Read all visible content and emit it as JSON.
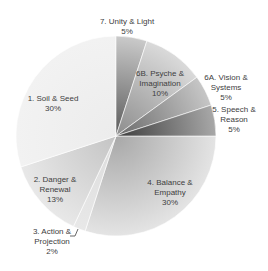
{
  "chart_data": {
    "type": "pie",
    "title": "",
    "start_angle_deg": 0,
    "direction": "clockwise",
    "categories": [
      "4. Balance & Empathy",
      "3. Action & Projection",
      "2. Danger & Renewal",
      "1. Soil & Seed",
      "7. Unity & Light",
      "6B. Psyche & Imagination",
      "6A. Vision & Systems",
      "5. Speech & Reason"
    ],
    "values": [
      30,
      2,
      13,
      30,
      5,
      10,
      5,
      5
    ],
    "unit": "%",
    "legend": "none (data labels on/near slices)",
    "slices": [
      {
        "id": "balance",
        "value": 30,
        "lines": [
          "4. Balance &",
          "Empathy",
          "30%"
        ],
        "label_x": 170,
        "label_y": 185,
        "inner": "#a8a8a8",
        "outer": "#e4e4e4"
      },
      {
        "id": "action",
        "value": 2,
        "lines": [
          "3. Action &",
          "Projection",
          "2%"
        ],
        "label_x": 52,
        "label_y": 234,
        "inner": "#dcdcdc",
        "outer": "#e8e8e8"
      },
      {
        "id": "danger",
        "value": 13,
        "lines": [
          "2. Danger &",
          "Renewal",
          "13%"
        ],
        "label_x": 55,
        "label_y": 182,
        "inner": "#c4c4c4",
        "outer": "#e8e8e8"
      },
      {
        "id": "soil",
        "value": 30,
        "lines": [
          "1. Soil & Seed",
          "30%"
        ],
        "label_x": 53,
        "label_y": 101,
        "inner": "#ececec",
        "outer": "#f2f2f2"
      },
      {
        "id": "unity",
        "value": 5,
        "lines": [
          "7. Unity & Light",
          "5%"
        ],
        "label_x": 127,
        "label_y": 24,
        "inner": "#5a5a5a",
        "outer": "#cacaca"
      },
      {
        "id": "psyche",
        "value": 10,
        "lines": [
          "6B. Psyche &",
          "Imagination",
          "10%"
        ],
        "label_x": 160,
        "label_y": 76,
        "inner": "#8c8c8c",
        "outer": "#dadada"
      },
      {
        "id": "vision",
        "value": 5,
        "lines": [
          "6A. Vision &",
          "Systems",
          "5%"
        ],
        "label_x": 226,
        "label_y": 80,
        "inner": "#6a6a6a",
        "outer": "#c6c6c6"
      },
      {
        "id": "speech",
        "value": 5,
        "lines": [
          "5. Speech &",
          "Reason",
          "5%"
        ],
        "label_x": 234,
        "label_y": 112,
        "inner": "#3c3c3c",
        "outer": "#a8a8a8"
      }
    ],
    "center": [
      116,
      136
    ],
    "radius": 100,
    "leader_line": {
      "for": "action",
      "points": [
        [
          70,
          236
        ],
        [
          75,
          236
        ],
        [
          78,
          229
        ]
      ]
    },
    "colors": {
      "label_text": "#404040",
      "background": "#ffffff"
    }
  }
}
